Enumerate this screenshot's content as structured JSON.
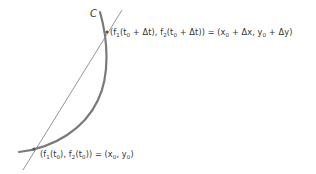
{
  "diagram": {
    "curve_label": "C",
    "colors": {
      "curve": "#7a7a7a",
      "secant": "#8a8a8a",
      "text": "#333333",
      "background": "#ffffff"
    },
    "upper_point": {
      "lhs": "(f₁(t₀ + Δt), f₂(t₀ + Δt))",
      "rhs": "(x₀ + Δx, y₀ + Δy)",
      "parts": {
        "a": "(f",
        "s1": "1",
        "b": "(t",
        "s2": "0",
        "c": " + Δt), f",
        "s3": "2",
        "d": "(t",
        "s4": "0",
        "e": " + Δt)) = (x",
        "s5": "0",
        "f": " + Δx, y",
        "s6": "0",
        "g": " + Δy)"
      }
    },
    "lower_point": {
      "lhs": "(f₁(t₀), f₂(t₀))",
      "rhs": "(x₀, y₀)",
      "parts": {
        "a": "(f",
        "s1": "1",
        "b": "(t",
        "s2": "0",
        "c": "), f",
        "s3": "2",
        "d": "(t",
        "s4": "0",
        "e": ")) = (x",
        "s5": "0",
        "f": ", y",
        "s6": "0",
        "g": ")"
      }
    }
  }
}
